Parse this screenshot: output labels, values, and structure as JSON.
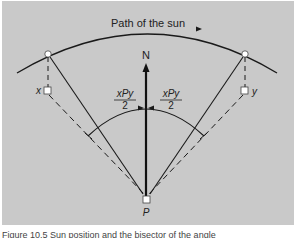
{
  "diagram": {
    "title": "Path of the sun",
    "north_label": "N",
    "observer_label": "P",
    "point_x_label": "x",
    "point_y_label": "y",
    "angle_label_numerator": "xPy",
    "angle_label_denominator": "2",
    "colors": {
      "background": "#c9c9c9",
      "lines": "#1a1a1a",
      "markers": "#ffffff"
    }
  },
  "caption": {
    "text": "Figure 10.5  Sun position and the bisector of the angle"
  }
}
